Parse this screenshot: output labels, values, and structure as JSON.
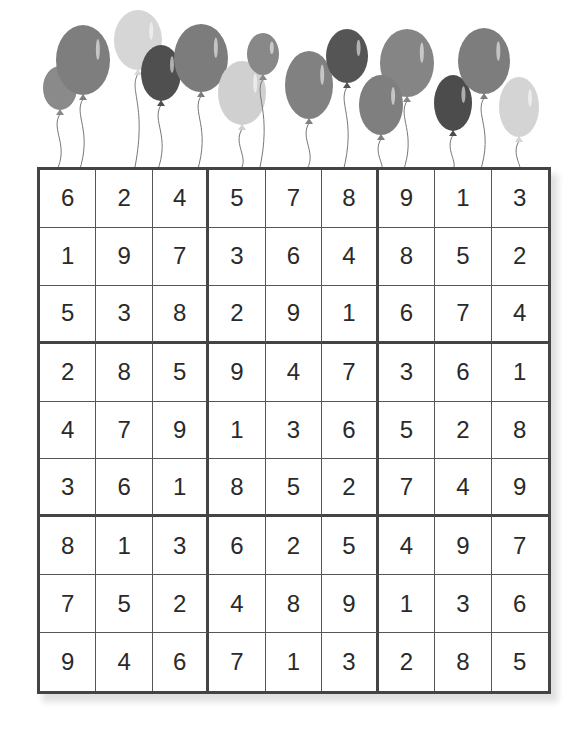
{
  "puzzle": {
    "type": "sudoku",
    "size": 9,
    "decoration": "balloons-banner",
    "grid": [
      [
        6,
        2,
        4,
        5,
        7,
        8,
        9,
        1,
        3
      ],
      [
        1,
        9,
        7,
        3,
        6,
        4,
        8,
        5,
        2
      ],
      [
        5,
        3,
        8,
        2,
        9,
        1,
        6,
        7,
        4
      ],
      [
        2,
        8,
        5,
        9,
        4,
        7,
        3,
        6,
        1
      ],
      [
        4,
        7,
        9,
        1,
        3,
        6,
        5,
        2,
        8
      ],
      [
        3,
        6,
        1,
        8,
        5,
        2,
        7,
        4,
        9
      ],
      [
        8,
        1,
        3,
        6,
        2,
        5,
        4,
        9,
        7
      ],
      [
        7,
        5,
        2,
        4,
        8,
        9,
        1,
        3,
        6
      ],
      [
        9,
        4,
        6,
        7,
        1,
        3,
        2,
        8,
        5
      ]
    ]
  },
  "balloons": [
    {
      "cx": 60,
      "cy": 88,
      "rx": 17,
      "ry": 22,
      "shade": "#8a8a8a"
    },
    {
      "cx": 83,
      "cy": 60,
      "rx": 27,
      "ry": 35,
      "shade": "#7e7e7e"
    },
    {
      "cx": 138,
      "cy": 40,
      "rx": 24,
      "ry": 30,
      "shade": "#d6d6d6"
    },
    {
      "cx": 161,
      "cy": 73,
      "rx": 20,
      "ry": 28,
      "shade": "#4f4f4f"
    },
    {
      "cx": 201,
      "cy": 58,
      "rx": 27,
      "ry": 34,
      "shade": "#7c7c7c"
    },
    {
      "cx": 242,
      "cy": 93,
      "rx": 24,
      "ry": 32,
      "shade": "#d0d0d0"
    },
    {
      "cx": 263,
      "cy": 54,
      "rx": 16,
      "ry": 21,
      "shade": "#888888"
    },
    {
      "cx": 309,
      "cy": 85,
      "rx": 24,
      "ry": 34,
      "shade": "#818181"
    },
    {
      "cx": 347,
      "cy": 56,
      "rx": 21,
      "ry": 27,
      "shade": "#555555"
    },
    {
      "cx": 407,
      "cy": 63,
      "rx": 27,
      "ry": 34,
      "shade": "#858585"
    },
    {
      "cx": 381,
      "cy": 105,
      "rx": 22,
      "ry": 30,
      "shade": "#7f7f7f"
    },
    {
      "cx": 453,
      "cy": 103,
      "rx": 19,
      "ry": 28,
      "shade": "#4c4c4c"
    },
    {
      "cx": 484,
      "cy": 61,
      "rx": 26,
      "ry": 33,
      "shade": "#7d7d7d"
    },
    {
      "cx": 519,
      "cy": 107,
      "rx": 20,
      "ry": 30,
      "shade": "#d4d4d4"
    }
  ]
}
